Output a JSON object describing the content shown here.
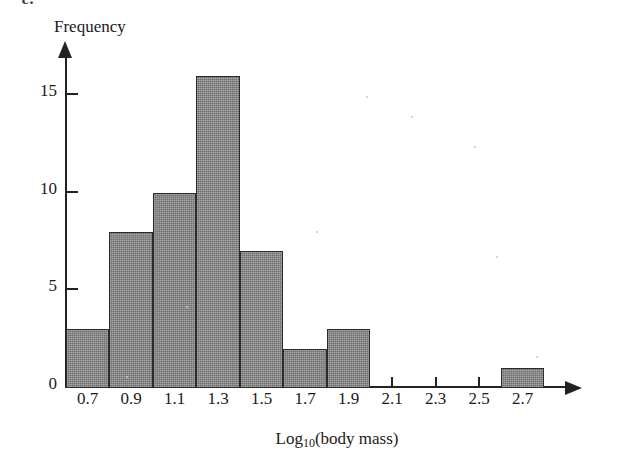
{
  "figure": {
    "panel_letter": "c.",
    "background_color": "#ffffff",
    "ink_color": "#222222",
    "bar_fill_color": "#868686",
    "bar_edge_color": "#2b2b2b"
  },
  "axes": {
    "y_title": "Frequency",
    "x_title_main": "Log",
    "x_title_sub": "10",
    "x_title_rest": "(body mass)",
    "x_title_full": "Log10(body mass)"
  },
  "chart_data": {
    "type": "bar",
    "title": "",
    "subtitle": "",
    "xlabel": "Log10(body mass)",
    "ylabel": "Frequency",
    "categories": [
      "0.7",
      "0.9",
      "1.1",
      "1.3",
      "1.5",
      "1.7",
      "1.9",
      "2.1",
      "2.3",
      "2.5",
      "2.7"
    ],
    "values": [
      3,
      8,
      10,
      16,
      7,
      2,
      3,
      0,
      0,
      0,
      1
    ],
    "bin_width": 0.2,
    "xlim": [
      0.6,
      2.9
    ],
    "ylim": [
      0,
      17
    ],
    "xticks": [
      0.7,
      0.9,
      1.1,
      1.3,
      1.5,
      1.7,
      1.9,
      2.1,
      2.3,
      2.5,
      2.7
    ],
    "xtick_labels": [
      "0.7",
      "0.9",
      "1.1",
      "1.3",
      "1.5",
      "1.7",
      "1.9",
      "2.1",
      "2.3",
      "2.5",
      "2.7"
    ],
    "yticks": [
      0,
      5,
      10,
      15
    ],
    "ytick_labels": [
      "0",
      "5",
      "10",
      "15"
    ],
    "grid": false,
    "legend": false,
    "legend_position": "none",
    "annotations": []
  }
}
